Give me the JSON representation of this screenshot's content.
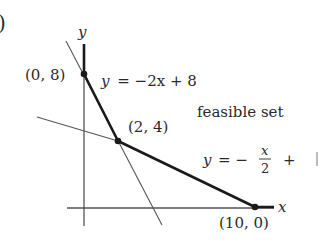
{
  "figure": {
    "panel_marker": ")",
    "axes": {
      "x_label": "x",
      "y_label": "y"
    },
    "points": [
      {
        "label": "(0, 8)",
        "x": 0,
        "y": 8
      },
      {
        "label": "(2, 4)",
        "x": 2,
        "y": 4
      },
      {
        "label": "(10, 0)",
        "x": 10,
        "y": 0
      }
    ],
    "lines": [
      {
        "equation_lhs": "y",
        "equation_rhs": "= −2x + 8",
        "slope": -2,
        "intercept": 8
      },
      {
        "equation_lhs": "y",
        "equation_rhs_prefix": "= −",
        "frac_num": "x",
        "frac_den": "2",
        "equation_rhs_suffix": "+",
        "slope": -0.5,
        "intercept": 4
      }
    ],
    "region_label": "feasible set",
    "colors": {
      "ink": "#1a1a1a",
      "thin_line": "#555555",
      "text": "#2a2a2a"
    }
  }
}
